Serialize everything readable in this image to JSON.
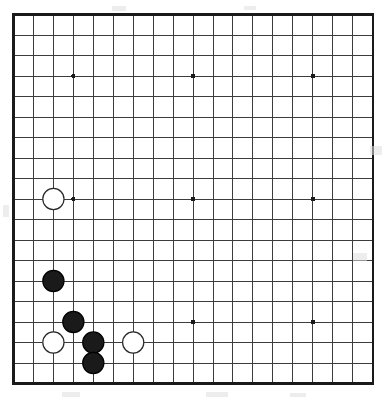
{
  "diagram": {
    "kind": "go-board-diagram",
    "board_size": 19,
    "background_color": "#ffffff",
    "line_color": "#3c3c3c",
    "border_color": "#1a1a1a",
    "star_point_color": "#1a1a1a",
    "black_stone_fill": "#1a1a1a",
    "black_stone_stroke": "#000000",
    "white_stone_fill": "#ffffff",
    "white_stone_stroke": "#2a2a2a"
  },
  "geometry": {
    "origin_x": 13.5,
    "origin_y": 14.5,
    "step_x": 19.95,
    "step_y": 20.5,
    "line_width": 1.0,
    "border_width": 2.2,
    "stone_radius": 10.6,
    "stone_stroke_width": 1.2,
    "star_radius": 2.3
  },
  "star_points": [
    {
      "col": 4,
      "row": 4
    },
    {
      "col": 10,
      "row": 4
    },
    {
      "col": 16,
      "row": 4
    },
    {
      "col": 4,
      "row": 10
    },
    {
      "col": 10,
      "row": 10
    },
    {
      "col": 16,
      "row": 10
    },
    {
      "col": 4,
      "row": 16
    },
    {
      "col": 10,
      "row": 16
    },
    {
      "col": 16,
      "row": 16
    }
  ],
  "stones": [
    {
      "color": "white",
      "col": 3,
      "row": 10,
      "label": "white-stone-c10"
    },
    {
      "color": "black",
      "col": 3,
      "row": 14,
      "label": "black-stone-c14"
    },
    {
      "color": "black",
      "col": 4,
      "row": 16,
      "label": "black-stone-d16"
    },
    {
      "color": "white",
      "col": 3,
      "row": 17,
      "label": "white-stone-c17"
    },
    {
      "color": "black",
      "col": 5,
      "row": 17,
      "label": "black-stone-e17"
    },
    {
      "color": "black",
      "col": 5,
      "row": 18,
      "label": "black-stone-e18"
    },
    {
      "color": "white",
      "col": 7,
      "row": 17,
      "label": "white-stone-g17"
    }
  ],
  "counts": {
    "black_stones": 4,
    "white_stones": 3,
    "total_stones": 7
  },
  "scan_artifacts": [
    {
      "x": 370,
      "y": 146,
      "w": 12,
      "h": 9
    },
    {
      "x": 353,
      "y": 253,
      "w": 14,
      "h": 8
    },
    {
      "x": 62,
      "y": 392,
      "w": 18,
      "h": 5
    },
    {
      "x": 206,
      "y": 392,
      "w": 22,
      "h": 5
    },
    {
      "x": 290,
      "y": 393,
      "w": 16,
      "h": 4
    },
    {
      "x": 3,
      "y": 205,
      "w": 6,
      "h": 12
    },
    {
      "x": 112,
      "y": 6,
      "w": 14,
      "h": 5
    },
    {
      "x": 244,
      "y": 6,
      "w": 12,
      "h": 4
    }
  ]
}
